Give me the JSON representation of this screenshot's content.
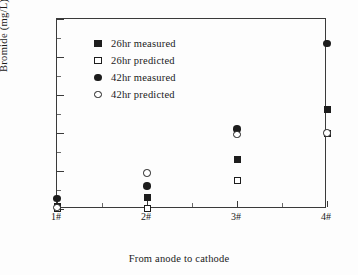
{
  "chart_data": {
    "type": "scatter",
    "title": "",
    "xlabel": "From anode to cathode",
    "ylabel": "Bromide (mg/L)",
    "categories": [
      "1#",
      "2#",
      "3#",
      "4#"
    ],
    "xtick_labels": [
      "1#",
      "2#",
      "3#",
      "4#"
    ],
    "ytick_labels": [
      "0",
      "500",
      "1000",
      "1500",
      "2000",
      "2500"
    ],
    "ytick_values": [
      0,
      500,
      1000,
      1500,
      2000,
      2500
    ],
    "ylim": [
      0,
      2500
    ],
    "xlim": [
      0,
      3
    ],
    "grid": false,
    "frame": "box",
    "legend_position": "upper-left-inside",
    "series": [
      {
        "name": "26hr measured",
        "marker": "filled-square",
        "color": "#1d1d1d",
        "values": [
          30,
          155,
          655,
          1305
        ]
      },
      {
        "name": "26hr predicted",
        "marker": "open-square",
        "color": "#1d1d1d",
        "values": [
          10,
          10,
          380,
          1000
        ]
      },
      {
        "name": "42hr measured",
        "marker": "filled-circle",
        "color": "#1d1d1d",
        "values": [
          140,
          305,
          1050,
          2180
        ]
      },
      {
        "name": "42hr predicted",
        "marker": "open-circle",
        "color": "#1d1d1d",
        "values": [
          20,
          475,
          980,
          1000
        ]
      }
    ]
  },
  "axes": {
    "y_title": "Bromide (mg/L)",
    "x_title": "From anode to cathode"
  },
  "legend": {
    "items": [
      {
        "label": "26hr measured",
        "marker": "filled-square"
      },
      {
        "label": "26hr predicted",
        "marker": "open-square"
      },
      {
        "label": "42hr measured",
        "marker": "filled-circle"
      },
      {
        "label": "42hr predicted",
        "marker": "open-circle"
      }
    ]
  }
}
